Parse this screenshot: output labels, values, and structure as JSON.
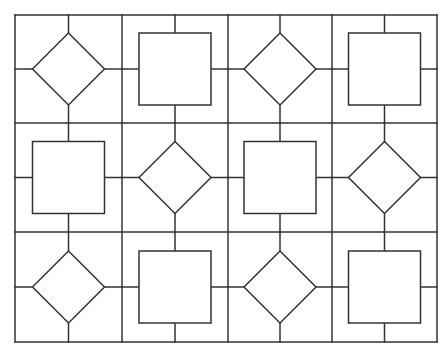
{
  "diagram": {
    "type": "tiled-pattern",
    "stroke_color": "#333333",
    "background_color": "#ffffff",
    "grid": {
      "rows": 3,
      "cols": 4,
      "x_lines": [
        15,
        122,
        228,
        332,
        437
      ],
      "y_lines": [
        15,
        123,
        232,
        342
      ]
    },
    "shape_size": 72,
    "cells": [
      [
        "diamond",
        "square",
        "diamond",
        "square"
      ],
      [
        "square",
        "diamond",
        "square",
        "diamond"
      ],
      [
        "diamond",
        "square",
        "diamond",
        "square"
      ]
    ]
  }
}
